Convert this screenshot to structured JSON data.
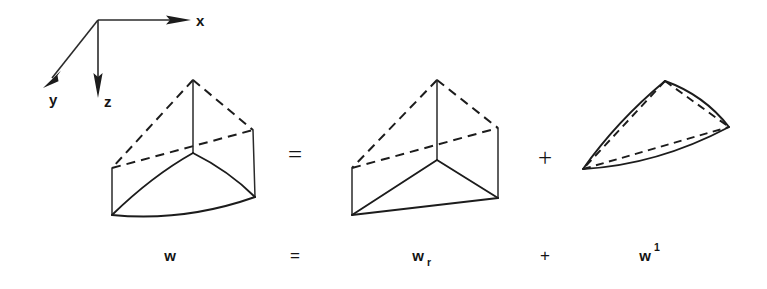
{
  "figure": {
    "caption_equation": "w = w_r + w^1",
    "background_color": "#ffffff",
    "ink_color": "#1c1c1c"
  },
  "axes": {
    "name": "coordinate-triad",
    "origin": {
      "x": 98,
      "y": 20
    },
    "items": [
      {
        "label": "x",
        "direction": "right",
        "tip": {
          "x": 188,
          "y": 20
        },
        "label_pos": {
          "x": 196,
          "y": 26
        }
      },
      {
        "label": "y",
        "direction": "down-left",
        "tip": {
          "x": 44,
          "y": 86
        },
        "label_pos": {
          "x": 49,
          "y": 104
        }
      },
      {
        "label": "z",
        "direction": "down",
        "tip": {
          "x": 98,
          "y": 97
        },
        "label_pos": {
          "x": 104,
          "y": 106
        }
      }
    ]
  },
  "equation": {
    "operators": [
      {
        "symbol": "=",
        "x": 295,
        "y": 163
      },
      {
        "symbol": "+",
        "x": 545,
        "y": 165
      }
    ],
    "term_operators": [
      {
        "symbol": "=",
        "x": 295,
        "y": 261
      },
      {
        "symbol": "+",
        "x": 545,
        "y": 261
      }
    ]
  },
  "terms": [
    {
      "id": "w",
      "base": "w",
      "sub": "",
      "sup": "",
      "x": 170,
      "y": 261
    },
    {
      "id": "w_r",
      "base": "w",
      "sub": "r",
      "sup": "",
      "x": 425,
      "y": 261
    },
    {
      "id": "w1",
      "base": "w",
      "sub": "",
      "sup": "1",
      "x": 650,
      "y": 261
    }
  ],
  "shapes": [
    {
      "id": "shape-w",
      "name": "curved-wedge-total",
      "description": "Triangular wedge with curved lower surface",
      "vertices": {
        "top_apex": {
          "x": 193,
          "y": 80
        },
        "top_left": {
          "x": 112,
          "y": 168
        },
        "top_right": {
          "x": 253,
          "y": 130
        },
        "mid_center": {
          "x": 193,
          "y": 153
        },
        "bottom_left": {
          "x": 112,
          "y": 215
        },
        "bottom_right": {
          "x": 255,
          "y": 197
        }
      },
      "edges": {
        "dashed": [
          "apex-left",
          "apex-right",
          "left-right"
        ],
        "solid": [
          "apex-center-vertical",
          "left-vertical",
          "right-vertical",
          "curved-front-left",
          "curved-front-right",
          "curved-bottom"
        ]
      }
    },
    {
      "id": "shape-wr",
      "name": "flat-wedge-regular",
      "description": "Triangular wedge with flat planar lower surface",
      "vertices": {
        "top_apex": {
          "x": 437,
          "y": 80
        },
        "top_left": {
          "x": 352,
          "y": 168
        },
        "top_right": {
          "x": 498,
          "y": 128
        },
        "mid_center": {
          "x": 437,
          "y": 160
        },
        "bottom_left": {
          "x": 352,
          "y": 215
        },
        "bottom_right": {
          "x": 498,
          "y": 198
        }
      },
      "edges": {
        "dashed": [
          "apex-left",
          "apex-right",
          "left-right"
        ],
        "solid": [
          "apex-center-vertical",
          "left-vertical",
          "right-vertical",
          "front-left",
          "front-right",
          "bottom"
        ]
      }
    },
    {
      "id": "shape-w1",
      "name": "curved-lens-correction",
      "description": "Thin lens-shaped difference region with curved solid edges and straight dashed chords",
      "vertices": {
        "apex": {
          "x": 665,
          "y": 81
        },
        "left": {
          "x": 583,
          "y": 169
        },
        "right": {
          "x": 729,
          "y": 127
        }
      },
      "edges": {
        "dashed": [
          "apex-left-chord",
          "apex-right-chord",
          "left-right-chord"
        ],
        "solid": [
          "apex-left-curve",
          "apex-right-curve",
          "left-right-curve"
        ]
      }
    }
  ]
}
